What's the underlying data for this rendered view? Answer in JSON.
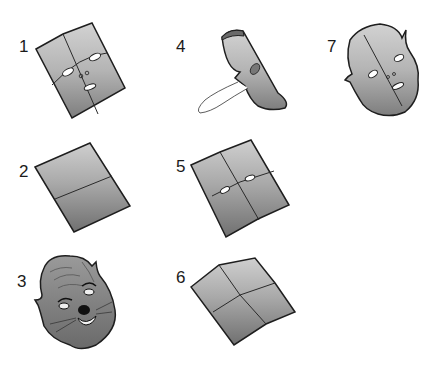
{
  "steps": [
    {
      "number": "1",
      "description": "Square folded in quarters with eye, nose and mouth holes cut"
    },
    {
      "number": "2",
      "description": "Square folded in half"
    },
    {
      "number": "3",
      "description": "Finished decorated animal mask"
    },
    {
      "number": "4",
      "description": "Folded half with outline for cutting"
    },
    {
      "number": "5",
      "description": "Opened square with eye holes"
    },
    {
      "number": "6",
      "description": "Square with quarter creases"
    },
    {
      "number": "7",
      "description": "Cut-out face shape with ears"
    }
  ],
  "colors": {
    "paper_light": "#c4c4c4",
    "paper_dark": "#8a8a8a",
    "outline": "#1e1e1e",
    "hole": "#ffffff"
  }
}
